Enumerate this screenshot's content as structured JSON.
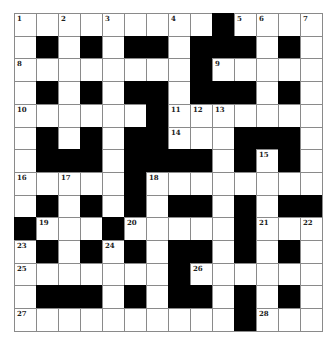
{
  "puzzle": {
    "rows": 14,
    "cols": 14,
    "colors": {
      "block": "#000000",
      "open": "#ffffff",
      "gridline": "#8a8a8a",
      "number": "#222222"
    },
    "legend": "B = black square, . = white square, number = numbered white square",
    "grid": [
      [
        "1",
        ".",
        "2",
        ".",
        "3",
        ".",
        ".",
        "4",
        ".",
        "B",
        "5",
        "6",
        ".",
        "7"
      ],
      [
        ".",
        "B",
        ".",
        "B",
        ".",
        "B",
        "B",
        ".",
        "B",
        "B",
        "B",
        ".",
        "B",
        "."
      ],
      [
        "8",
        ".",
        ".",
        ".",
        ".",
        ".",
        ".",
        ".",
        "B",
        "9",
        ".",
        ".",
        ".",
        "."
      ],
      [
        ".",
        "B",
        ".",
        "B",
        ".",
        "B",
        "B",
        ".",
        "B",
        "B",
        "B",
        ".",
        "B",
        "."
      ],
      [
        "10",
        ".",
        ".",
        ".",
        ".",
        ".",
        "B",
        "11",
        "12",
        "13",
        ".",
        ".",
        ".",
        "."
      ],
      [
        ".",
        "B",
        ".",
        "B",
        ".",
        "B",
        "B",
        "14",
        ".",
        ".",
        "B",
        "B",
        "B",
        "."
      ],
      [
        ".",
        "B",
        "B",
        "B",
        ".",
        "B",
        "B",
        "B",
        "B",
        ".",
        "B",
        "15",
        "B",
        "."
      ],
      [
        "16",
        ".",
        "17",
        ".",
        ".",
        "B",
        "18",
        ".",
        ".",
        ".",
        ".",
        ".",
        ".",
        "."
      ],
      [
        ".",
        "B",
        ".",
        "B",
        ".",
        "B",
        ".",
        "B",
        "B",
        ".",
        "B",
        ".",
        "B",
        "B"
      ],
      [
        "B",
        "19",
        ".",
        ".",
        "B",
        "20",
        ".",
        ".",
        ".",
        ".",
        "B",
        "21",
        ".",
        "22"
      ],
      [
        "23",
        "B",
        ".",
        "B",
        "24",
        "B",
        ".",
        "B",
        "B",
        ".",
        "B",
        ".",
        "B",
        "."
      ],
      [
        "25",
        ".",
        ".",
        ".",
        ".",
        ".",
        ".",
        "B",
        "26",
        ".",
        ".",
        ".",
        ".",
        "."
      ],
      [
        ".",
        "B",
        "B",
        "B",
        ".",
        "B",
        ".",
        "B",
        "B",
        ".",
        "B",
        ".",
        "B",
        "."
      ],
      [
        "27",
        ".",
        ".",
        ".",
        ".",
        ".",
        ".",
        ".",
        ".",
        ".",
        "B",
        "28",
        ".",
        "."
      ]
    ]
  }
}
